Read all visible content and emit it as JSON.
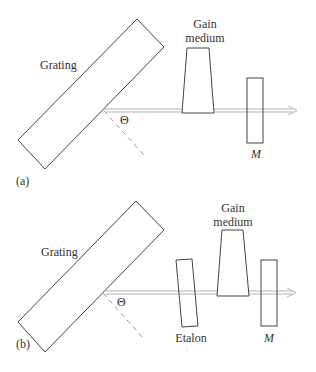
{
  "panels": [
    {
      "id": "a",
      "tag": "(a)",
      "labels": {
        "grating": "Grating",
        "gain_line1": "Gain",
        "gain_line2": "medium",
        "mirror": "M",
        "angle": "Θ"
      },
      "components": [
        "Grating",
        "Gain medium",
        "M"
      ]
    },
    {
      "id": "b",
      "tag": "(b)",
      "labels": {
        "grating": "Grating",
        "gain_line1": "Gain",
        "gain_line2": "medium",
        "etalon": "Etalon",
        "mirror": "M",
        "angle": "Θ"
      },
      "components": [
        "Grating",
        "Etalon",
        "Gain medium",
        "M"
      ]
    }
  ],
  "colors": {
    "outline": "#444444",
    "beam": "#aaaaaa",
    "dashed": "#999999",
    "text": "#333333"
  }
}
